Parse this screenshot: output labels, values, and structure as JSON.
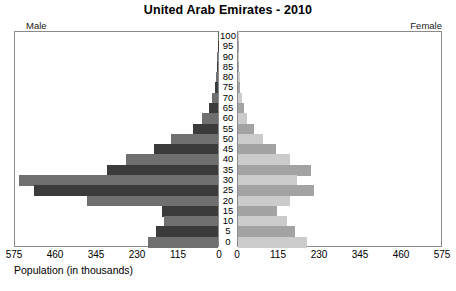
{
  "header": {
    "title": "United Arab Emirates - 2010",
    "male_label": "Male",
    "female_label": "Female"
  },
  "axis": {
    "x_label": "Population (in thousands)",
    "x_ticks": [
      "575",
      "460",
      "345",
      "230",
      "115",
      "0"
    ],
    "x_ticks_female": [
      "0",
      "115",
      "230",
      "345",
      "460",
      "575"
    ],
    "x_max": 575,
    "age_ticks": [
      "100",
      "95",
      "90",
      "85",
      "80",
      "75",
      "70",
      "65",
      "60",
      "55",
      "50",
      "45",
      "40",
      "35",
      "30",
      "25",
      "20",
      "15",
      "10",
      "5",
      "0"
    ]
  },
  "colors": {
    "male_dark": "#3b3b3b",
    "male_mid": "#6f6f6f",
    "female_light": "#cbcbcb",
    "female_mid": "#a3a3a3",
    "frame": "#8b8b8b",
    "background": "#ffffff"
  },
  "chart_data": {
    "type": "bar",
    "title": "United Arab Emirates - 2010",
    "subtitle": "",
    "xlabel": "Population (in thousands)",
    "ylabel": "",
    "xlim": [
      0,
      575
    ],
    "grid": false,
    "legend": [
      "Male",
      "Female"
    ],
    "legend_position": "top-corners",
    "orientation": "horizontal-pyramid",
    "categories": [
      "100",
      "95",
      "90",
      "85",
      "80",
      "75",
      "70",
      "65",
      "60",
      "55",
      "50",
      "45",
      "40",
      "35",
      "30",
      "25",
      "20",
      "15",
      "10",
      "5",
      "0"
    ],
    "series": [
      {
        "name": "Male",
        "side": "left",
        "values": [
          1,
          1,
          2,
          3,
          5,
          9,
          17,
          26,
          45,
          72,
          133,
          182,
          262,
          314,
          565,
          522,
          370,
          160,
          152,
          175,
          198
        ]
      },
      {
        "name": "Female",
        "side": "right",
        "values": [
          1,
          1,
          2,
          3,
          5,
          7,
          11,
          16,
          26,
          46,
          72,
          107,
          147,
          206,
          166,
          214,
          147,
          110,
          139,
          162,
          196
        ]
      }
    ]
  }
}
